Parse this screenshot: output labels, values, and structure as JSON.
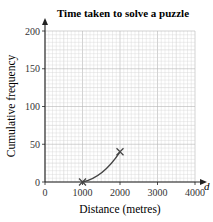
{
  "chart_data": {
    "type": "line",
    "title": "Time taken to solve a puzzle",
    "xlabel": "Distance (metres)",
    "ylabel": "Cumulative frequency",
    "x_axis_symbol": "d",
    "xlim": [
      0,
      4000
    ],
    "ylim": [
      0,
      200
    ],
    "x_ticks": [
      0,
      1000,
      2000,
      3000,
      4000
    ],
    "y_ticks": [
      0,
      50,
      100,
      150,
      200
    ],
    "grid": true,
    "legend": null,
    "series": [
      {
        "name": "cumulative frequency curve",
        "points": [
          {
            "x": 1000,
            "y": 0
          },
          {
            "x": 2000,
            "y": 40
          }
        ],
        "marker": "cross",
        "curve": "concave-up"
      }
    ]
  },
  "colors": {
    "grid_minor": "#d4d4d4",
    "grid_major": "#b5b5b5",
    "axis": "#222222",
    "curve": "#444444"
  }
}
